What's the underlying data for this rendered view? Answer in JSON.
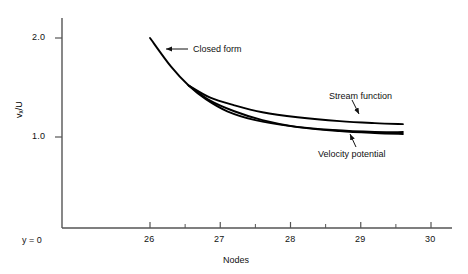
{
  "chart_data": {
    "type": "line",
    "title": "",
    "xlabel": "Nodes",
    "ylabel": "vx/U",
    "ylabel_parts": {
      "base": "v",
      "sub": "x",
      "tail": "/U"
    },
    "xlim": [
      25.1,
      30.4
    ],
    "ylim": [
      0.0,
      2.35
    ],
    "xticks": [
      26,
      27,
      28,
      29,
      30
    ],
    "xtick_labels": [
      "26",
      "27",
      "28",
      "29",
      "30"
    ],
    "x_minor_ticks": [
      26.5,
      27.5,
      28.5,
      29.5
    ],
    "yticks": [
      1.0,
      2.0
    ],
    "ytick_labels": [
      "1.0",
      "2.0"
    ],
    "origin_label": "y = 0",
    "grid": false,
    "legend": "inline-annotations",
    "series": [
      {
        "name": "Closed form",
        "points": [
          [
            26.0,
            2.0
          ],
          [
            26.3,
            1.71
          ],
          [
            26.55,
            1.52
          ],
          [
            26.8,
            1.38
          ],
          [
            27.1,
            1.26
          ],
          [
            27.5,
            1.17
          ],
          [
            28.0,
            1.11
          ],
          [
            28.6,
            1.07
          ],
          [
            29.2,
            1.05
          ],
          [
            29.6,
            1.05
          ]
        ]
      },
      {
        "name": "Stream function",
        "points": [
          [
            26.55,
            1.52
          ],
          [
            26.85,
            1.4
          ],
          [
            27.2,
            1.32
          ],
          [
            27.6,
            1.25
          ],
          [
            28.1,
            1.2
          ],
          [
            28.7,
            1.16
          ],
          [
            29.2,
            1.14
          ],
          [
            29.6,
            1.13
          ]
        ]
      },
      {
        "name": "Velocity potential",
        "points": [
          [
            26.55,
            1.52
          ],
          [
            26.85,
            1.37
          ],
          [
            27.2,
            1.26
          ],
          [
            27.6,
            1.17
          ],
          [
            28.1,
            1.1
          ],
          [
            28.7,
            1.06
          ],
          [
            29.2,
            1.04
          ],
          [
            29.6,
            1.03
          ]
        ]
      }
    ],
    "annotations": [
      {
        "name": "closed-form",
        "text": "Closed form",
        "label_x": 193,
        "label_y": 45,
        "leader_from": [
          188,
          49
        ],
        "leader_to": [
          166,
          49
        ],
        "arrow_at": [
          166,
          49
        ]
      },
      {
        "name": "stream-function",
        "text": "Stream function",
        "label_x": 329,
        "label_y": 92,
        "leader_from": [
          352,
          100
        ],
        "leader_to": [
          359,
          114
        ],
        "arrow_at": [
          359,
          114
        ]
      },
      {
        "name": "velocity-potential",
        "text": "Velocity potential",
        "label_x": 318,
        "label_y": 150,
        "leader_from": [
          356,
          147
        ],
        "leader_to": [
          350,
          134
        ],
        "arrow_at": [
          350,
          134
        ]
      }
    ]
  },
  "axis": {
    "x_tick_label_0": "26",
    "x_tick_label_1": "27",
    "x_tick_label_2": "28",
    "x_tick_label_3": "29",
    "x_tick_label_4": "30",
    "y_tick_label_0": "1.0",
    "y_tick_label_1": "2.0",
    "x_axis_title": "Nodes",
    "origin_label": "y = 0",
    "y_base": "v",
    "y_sub": "x",
    "y_tail": "/U"
  },
  "annotation_text": {
    "closed_form": "Closed form",
    "stream_function": "Stream function",
    "velocity_potential": "Velocity potential"
  },
  "colors": {
    "curve": "#000000",
    "axis": "#555555",
    "text": "#111111",
    "background": "#ffffff"
  }
}
